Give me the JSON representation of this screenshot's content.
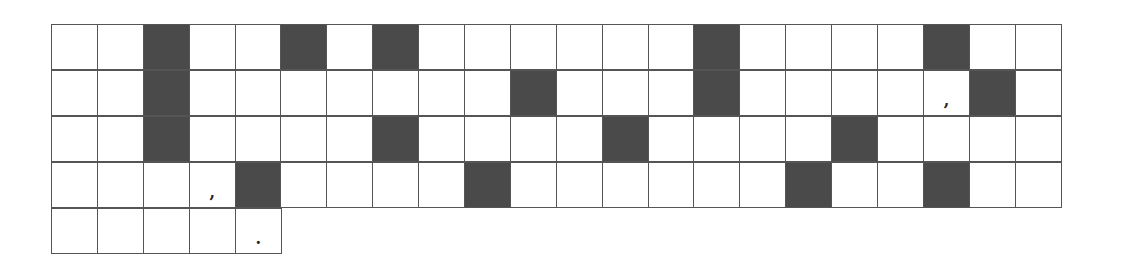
{
  "grid": {
    "columns": 22,
    "colors": {
      "dark": "#4a4a4a",
      "light": "#ffffff",
      "border": "#555555"
    },
    "rows": [
      {
        "length": 22,
        "dark": [
          2,
          5,
          7,
          14,
          19
        ],
        "marks": {}
      },
      {
        "length": 22,
        "dark": [
          2,
          10,
          14,
          20
        ],
        "marks": {
          "19": ","
        }
      },
      {
        "length": 22,
        "dark": [
          2,
          7,
          12,
          17
        ],
        "marks": {}
      },
      {
        "length": 22,
        "dark": [
          4,
          9,
          16,
          19
        ],
        "marks": {
          "3": ","
        }
      },
      {
        "length": 5,
        "dark": [],
        "marks": {
          "4": "."
        }
      }
    ]
  }
}
